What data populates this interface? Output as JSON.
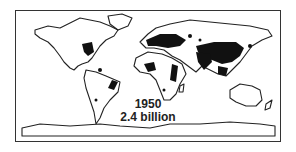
{
  "map": {
    "title_year": "1950",
    "population": "2.4 billion",
    "description": "World map showing population density distribution in 1950",
    "colors": {
      "land_outline": "#222222",
      "density": "#111111",
      "background": "#ffffff"
    }
  }
}
